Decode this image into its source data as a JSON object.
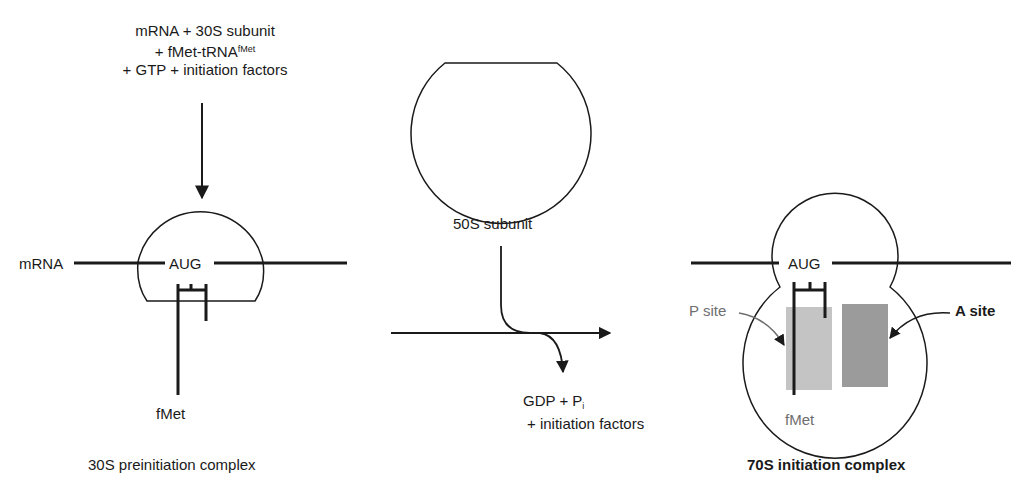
{
  "inputs": {
    "line1": "mRNA + 30S subunit",
    "line2_prefix": "+ fMet-tRNA",
    "line2_sup": "fMet",
    "line3": "+ GTP + initiation factors"
  },
  "complex_30s": {
    "mrna_label": "mRNA",
    "codon_label": "AUG",
    "amino_acid_label": "fMet",
    "caption": "30S preinitiation complex"
  },
  "subunit_50s": {
    "caption": "50S subunit"
  },
  "byproducts": {
    "line1_prefix": "GDP + P",
    "line1_sub": "i",
    "line2": "+ initiation factors"
  },
  "complex_70s": {
    "codon_label": "AUG",
    "p_site_label": "P site",
    "a_site_label": "A site",
    "amino_acid_label": "fMet",
    "caption": "70S initiation complex"
  },
  "colors": {
    "line": "#1a1a1a",
    "p_site_fill": "#c4c4c4",
    "a_site_fill": "#9b9b9b",
    "p_site_label": "#6e6e6e"
  }
}
